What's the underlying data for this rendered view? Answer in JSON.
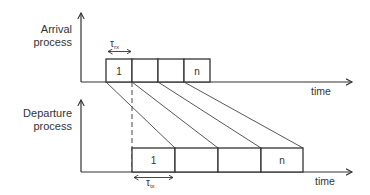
{
  "diagram": {
    "arrival": {
      "label_line1": "Arrival",
      "label_line2": "process",
      "axis_label": "time",
      "tau_label": "τ",
      "tau_sub": "rx",
      "packets": [
        "1",
        "",
        "",
        "n"
      ]
    },
    "departure": {
      "label_line1": "Departure",
      "label_line2": "process",
      "axis_label": "time",
      "tau_label": "τ",
      "tau_sub": "tx",
      "packets": [
        "1",
        "",
        "",
        "n"
      ]
    },
    "colors": {
      "stroke": "#333333",
      "background": "#ffffff"
    }
  }
}
